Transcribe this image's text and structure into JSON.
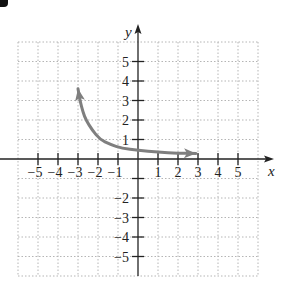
{
  "chart_data": {
    "type": "line",
    "title": "",
    "xlabel": "x",
    "ylabel": "y",
    "xlim": [
      -6,
      6
    ],
    "ylim": [
      -6,
      6
    ],
    "grid": true,
    "x_ticks": [
      -5,
      -4,
      -3,
      -2,
      -1,
      1,
      2,
      3,
      4,
      5
    ],
    "y_ticks": [
      -5,
      -4,
      -3,
      -2,
      -1,
      1,
      2,
      3,
      4,
      5
    ],
    "x_tick_labels": [
      "−5",
      "−4",
      "−3",
      "−2",
      "−1",
      "1",
      "2",
      "3",
      "4",
      "5"
    ],
    "y_tick_labels": [
      "5",
      "4",
      "3",
      "2",
      "1",
      "−2",
      "−3",
      "−4",
      "−5"
    ],
    "series": [
      {
        "name": "curve",
        "color": "#7f7f7f",
        "arrows": "both",
        "x": [
          -3.0,
          -2.9,
          -2.75,
          -2.6,
          -2.3,
          -1.9,
          -1.4,
          -0.8,
          0.0,
          1.0,
          2.0,
          2.9
        ],
        "y": [
          3.6,
          3.0,
          2.4,
          2.0,
          1.5,
          1.0,
          0.75,
          0.55,
          0.45,
          0.35,
          0.3,
          0.28
        ]
      }
    ]
  },
  "labels": {
    "x_axis": "x",
    "y_axis": "y"
  },
  "colors": {
    "axis": "#222222",
    "grid": "#b5b5b5",
    "curve": "#7f7f7f"
  }
}
